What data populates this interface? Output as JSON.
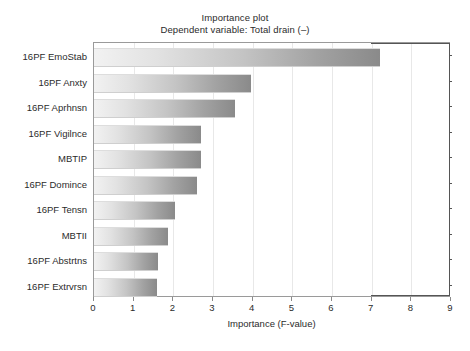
{
  "chart_data": {
    "type": "bar",
    "orientation": "horizontal",
    "title": "Importance plot",
    "subtitle": "Dependent variable: Total drain (–)",
    "xlabel": "Importance (F-value)",
    "ylabel": "",
    "xlim": [
      0,
      9
    ],
    "xticks": [
      0,
      1,
      2,
      3,
      4,
      5,
      6,
      7,
      8,
      9
    ],
    "xticklabels": [
      "0",
      "1",
      "2",
      "3",
      "4",
      "5",
      "6",
      "7",
      "8",
      "9"
    ],
    "grid": true,
    "legend": false,
    "categories": [
      "16PF  EmoStab",
      "16PF  Anxty",
      "16PF  Aprhnsn",
      "16PF  Vigilnce",
      "MBTIP",
      "16PF  Domince",
      "16PF  Tensn",
      "MBTII",
      "16PF  Abstrtns",
      "16PF  Extrvrsn"
    ],
    "values": [
      7.22,
      3.97,
      3.55,
      2.69,
      2.69,
      2.6,
      2.04,
      1.87,
      1.62,
      1.6
    ],
    "bars": [
      {
        "label": "16PF  EmoStab",
        "value": 7.22
      },
      {
        "label": "16PF  Anxty",
        "value": 3.97
      },
      {
        "label": "16PF  Aprhnsn",
        "value": 3.55
      },
      {
        "label": "16PF  Vigilnce",
        "value": 2.69
      },
      {
        "label": "MBTIP",
        "value": 2.69
      },
      {
        "label": "16PF  Domince",
        "value": 2.6
      },
      {
        "label": "16PF  Tensn",
        "value": 2.04
      },
      {
        "label": "MBTII",
        "value": 1.87
      },
      {
        "label": "16PF  Abstrtns",
        "value": 1.62
      },
      {
        "label": "16PF  Extrvrsn",
        "value": 1.6
      }
    ],
    "colors": {
      "bar_gradient_start": "#f2f2f2",
      "bar_gradient_end": "#8a8a8a",
      "axis": "#9a9a9a",
      "axis_highlight": "#555555",
      "gridline": "#e8e8e8",
      "text": "#2b2b2b",
      "background": "#ffffff"
    }
  }
}
